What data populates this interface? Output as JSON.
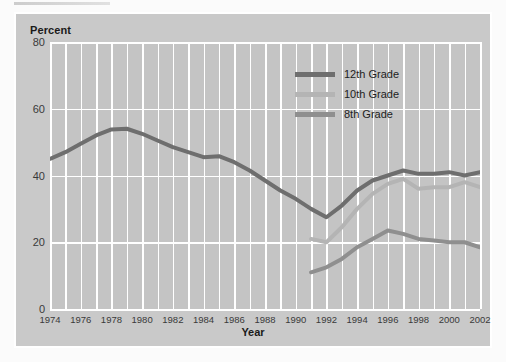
{
  "figure": {
    "y_axis_title": "Percent",
    "x_axis_title": "Year"
  },
  "legend": {
    "position": "top-right",
    "items": [
      {
        "label": "12th Grade",
        "color": "#6e6e6e"
      },
      {
        "label": "10th Grade",
        "color": "#b4b4b4"
      },
      {
        "label": "8th Grade",
        "color": "#8f8f8f"
      }
    ]
  },
  "chart_data": {
    "type": "line",
    "title": "",
    "xlabel": "Year",
    "ylabel": "Percent",
    "xlim": [
      1974,
      2002
    ],
    "ylim": [
      0,
      80
    ],
    "yticks": [
      0,
      20,
      40,
      60,
      80
    ],
    "xticks": [
      1974,
      1976,
      1978,
      1980,
      1982,
      1984,
      1986,
      1988,
      1990,
      1992,
      1994,
      1996,
      1998,
      2000,
      2002
    ],
    "grid": "vertical-every-year-plus-horizontal-major",
    "plot_background": "#c4c4c4",
    "gridline_color": "#ffffff",
    "series": [
      {
        "name": "12th Grade",
        "color": "#6e6e6e",
        "x": [
          1974,
          1975,
          1976,
          1977,
          1978,
          1979,
          1980,
          1981,
          1982,
          1983,
          1984,
          1985,
          1986,
          1987,
          1988,
          1989,
          1990,
          1991,
          1992,
          1993,
          1994,
          1995,
          1996,
          1997,
          1998,
          1999,
          2000,
          2001,
          2002
        ],
        "values": [
          45.0,
          47.0,
          49.5,
          52.0,
          53.8,
          54.0,
          52.5,
          50.5,
          48.5,
          47.0,
          45.5,
          45.8,
          44.0,
          41.5,
          38.5,
          35.5,
          33.0,
          30.0,
          27.5,
          31.0,
          35.5,
          38.5,
          40.0,
          41.5,
          40.5,
          40.5,
          41.0,
          40.0,
          41.0
        ]
      },
      {
        "name": "10th Grade",
        "color": "#b4b4b4",
        "x": [
          1991,
          1992,
          1993,
          1994,
          1995,
          1996,
          1997,
          1998,
          1999,
          2000,
          2001,
          2002
        ],
        "values": [
          21.0,
          20.0,
          24.5,
          30.0,
          34.5,
          37.5,
          39.0,
          36.0,
          36.5,
          36.5,
          38.0,
          36.5
        ]
      },
      {
        "name": "8th Grade",
        "color": "#8f8f8f",
        "x": [
          1991,
          1992,
          1993,
          1994,
          1995,
          1996,
          1997,
          1998,
          1999,
          2000,
          2001,
          2002
        ],
        "values": [
          11.0,
          12.5,
          15.0,
          18.5,
          21.0,
          23.5,
          22.5,
          21.0,
          20.5,
          20.0,
          20.0,
          18.5
        ]
      }
    ]
  }
}
